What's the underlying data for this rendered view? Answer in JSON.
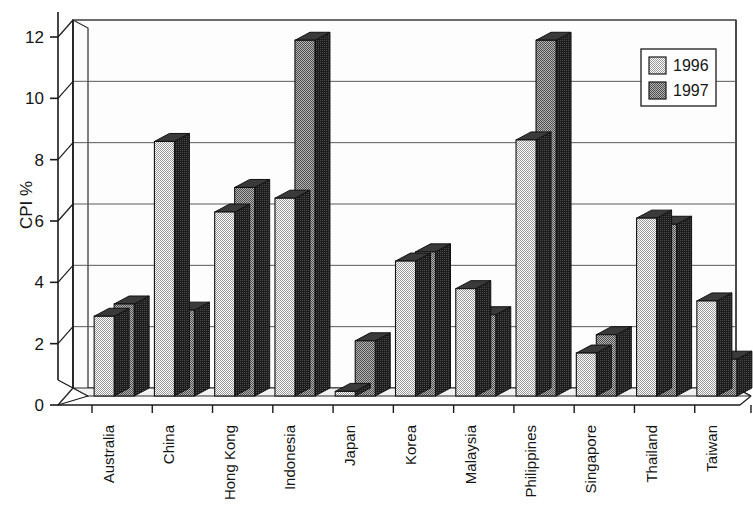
{
  "chart_data": {
    "type": "bar",
    "title": "",
    "subtitle": "",
    "xlabel": "",
    "ylabel": "CPI %",
    "ylim": [
      0,
      12
    ],
    "ytick_step": 2,
    "yticks": [
      "0",
      "2",
      "4",
      "6",
      "8",
      "10",
      "12"
    ],
    "grid": true,
    "legend_position": "top-right",
    "style": "3d-column",
    "categories": [
      "Australia",
      "China",
      "Hong Kong",
      "Indonesia",
      "Japan",
      "Korea",
      "Malaysia",
      "Philippines",
      "Singapore",
      "Thailand",
      "Taiwan"
    ],
    "series": [
      {
        "name": "1996",
        "color": "#c9c9c9",
        "values": [
          2.6,
          8.3,
          6.0,
          6.45,
          0.15,
          4.4,
          3.5,
          8.35,
          1.4,
          5.8,
          3.1
        ]
      },
      {
        "name": "1997",
        "color": "#8f8f8f",
        "values": [
          3.0,
          2.8,
          6.8,
          11.6,
          1.8,
          4.7,
          2.65,
          11.6,
          2.0,
          5.6,
          1.2
        ]
      }
    ]
  },
  "legend": {
    "entries": [
      {
        "label": "1996",
        "swatch": "#c9c9c9"
      },
      {
        "label": "1997",
        "swatch": "#8f8f8f"
      }
    ]
  },
  "colors": {
    "background": "#ffffff",
    "axis": "#1a1a1a",
    "gridline": "#5a5a5a",
    "series_1996": "#c9c9c9",
    "series_1997": "#8f8f8f",
    "bar_side": "#2a2a2a",
    "bar_outline": "#111111",
    "plot_floor": "#f2f2f2",
    "plot_wall": "#fdfdfd"
  }
}
